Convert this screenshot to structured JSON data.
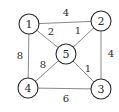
{
  "diagram": {
    "type": "weighted-undirected-graph",
    "nodes": [
      {
        "id": "1",
        "label": "1",
        "x": 29,
        "y": 24
      },
      {
        "id": "2",
        "label": "2",
        "x": 101,
        "y": 21
      },
      {
        "id": "3",
        "label": "3",
        "x": 101,
        "y": 89
      },
      {
        "id": "4",
        "label": "4",
        "x": 28,
        "y": 88
      },
      {
        "id": "5",
        "label": "5",
        "x": 66,
        "y": 54
      }
    ],
    "edges": [
      {
        "from": "1",
        "to": "2",
        "weight": "4",
        "label_x": 66,
        "label_y": 16
      },
      {
        "from": "1",
        "to": "5",
        "weight": "2",
        "label_x": 51,
        "label_y": 35
      },
      {
        "from": "5",
        "to": "2",
        "weight": "1",
        "label_x": 78,
        "label_y": 34
      },
      {
        "from": "1",
        "to": "4",
        "weight": "8",
        "label_x": 20,
        "label_y": 59
      },
      {
        "from": "2",
        "to": "3",
        "weight": "4",
        "label_x": 111,
        "label_y": 57
      },
      {
        "from": "5",
        "to": "4",
        "weight": "8",
        "label_x": 43,
        "label_y": 68
      },
      {
        "from": "5",
        "to": "3",
        "weight": "1",
        "label_x": 88,
        "label_y": 72
      },
      {
        "from": "4",
        "to": "3",
        "weight": "6",
        "label_x": 66,
        "label_y": 102
      }
    ],
    "node_radius": 10
  }
}
